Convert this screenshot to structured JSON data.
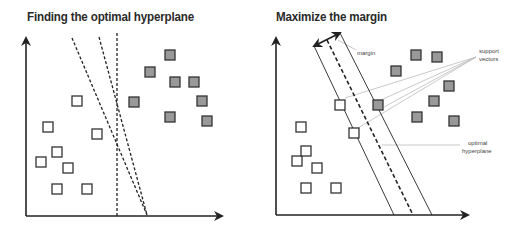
{
  "panels": [
    {
      "title": "Finding the optimal hyperplane",
      "axes": {
        "origin": [
          26,
          216
        ],
        "y_top": 36,
        "x_right": 224
      },
      "class_a_points": [
        [
          77,
          101
        ],
        [
          48,
          127
        ],
        [
          97,
          134
        ],
        [
          57,
          152
        ],
        [
          41,
          162
        ],
        [
          68,
          168
        ],
        [
          57,
          189
        ],
        [
          87,
          189
        ]
      ],
      "class_b_points": [
        [
          170,
          55
        ],
        [
          150,
          72
        ],
        [
          175,
          82
        ],
        [
          194,
          82
        ],
        [
          134,
          102
        ],
        [
          202,
          101
        ],
        [
          170,
          117
        ],
        [
          207,
          121
        ]
      ],
      "candidate_lines": [
        {
          "from": [
            117,
            33
          ],
          "to": [
            117,
            216
          ]
        },
        {
          "from": [
            72,
            38
          ],
          "to": [
            147,
            215
          ]
        },
        {
          "from": [
            99,
            37
          ],
          "to": [
            147,
            215
          ]
        }
      ]
    },
    {
      "title": "Maximize the margin",
      "axes": {
        "origin": [
          276,
          215
        ],
        "y_top": 36,
        "x_right": 470
      },
      "class_a_points": [
        [
          301,
          127
        ],
        [
          340,
          105
        ],
        [
          354,
          133
        ],
        [
          297,
          161
        ],
        [
          306,
          151
        ],
        [
          317,
          168
        ],
        [
          306,
          188
        ],
        [
          336,
          188
        ]
      ],
      "class_b_points": [
        [
          378,
          105
        ],
        [
          396,
          71
        ],
        [
          416,
          55
        ],
        [
          437,
          57
        ],
        [
          449,
          86
        ],
        [
          434,
          101
        ],
        [
          417,
          117
        ],
        [
          454,
          121
        ]
      ],
      "margin_lines": [
        {
          "from": [
            314,
            46
          ],
          "to": [
            394,
            215
          ],
          "style": "solid"
        },
        {
          "from": [
            340,
            33
          ],
          "to": [
            432,
            215
          ],
          "style": "solid"
        }
      ],
      "hyperplane": {
        "from": [
          327,
          40
        ],
        "to": [
          413,
          215
        ],
        "style": "dashed"
      },
      "margin_arrow": {
        "from": [
          314,
          46
        ],
        "to": [
          340,
          33
        ]
      },
      "annotations": {
        "margin": "margin",
        "support_vectors_line1": "support",
        "support_vectors_line2": "vectors",
        "optimal_hyperplane_line1": "optimal",
        "optimal_hyperplane_line2": "hyperplane"
      }
    }
  ],
  "colors": {
    "axis": "#222222",
    "class_a_fill": "#ffffff",
    "class_b_fill": "#999999",
    "square_stroke": "#333333",
    "leader": "#bbbbbb"
  }
}
